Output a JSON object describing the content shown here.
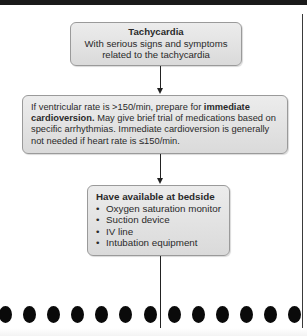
{
  "diagram": {
    "type": "flowchart",
    "nodes": [
      {
        "id": "tachycardia",
        "title": "Tachycardia",
        "lines": [
          "With serious signs and symptoms",
          "related to the tachycardia"
        ]
      },
      {
        "id": "cardioversion",
        "text_part1": "If ventricular rate is >150/min, prepare for ",
        "text_bold": "immediate cardioversion.",
        "text_part2": " May give brief trial of medications based on specific arrhythmias. Immediate cardioversion is generally not needed if heart rate is ≤150/min."
      },
      {
        "id": "bedside",
        "title": "Have available at bedside",
        "items": [
          "Oxygen saturation monitor",
          "Suction device",
          "IV line",
          "Intubation equipment"
        ]
      }
    ],
    "edges": [
      {
        "from": "tachycardia",
        "to": "cardioversion",
        "arrow": true
      },
      {
        "from": "cardioversion",
        "to": "bedside",
        "arrow": true
      },
      {
        "from": "bedside",
        "to": "continues-below",
        "arrow": false
      }
    ],
    "page_break_dots": 13
  },
  "colors": {
    "box_fill_top": "#ececec",
    "box_fill_bottom": "#dadada",
    "box_border": "#9a9a9a",
    "line": "#222222",
    "dots": "#0a0a0a"
  }
}
